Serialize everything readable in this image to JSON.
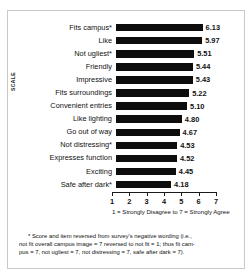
{
  "chart_data": {
    "type": "bar",
    "orientation": "horizontal",
    "title": "",
    "xlabel": "1 = Strongly Disagree to 7 = Strongly Agree",
    "ylabel": "SCALE",
    "xlim": [
      1,
      7
    ],
    "xticks": [
      1,
      2,
      3,
      4,
      5,
      6,
      7
    ],
    "grid": false,
    "legend": false,
    "categories": [
      "Fits campus*",
      "Like",
      "Not ugliest*",
      "Friendly",
      "Impressive",
      "Fits surroundings",
      "Convenient entries",
      "Like lighting",
      "Go out of way",
      "Not distressing*",
      "Expresses function",
      "Exciting",
      "Safe after dark*"
    ],
    "values": [
      6.13,
      5.97,
      5.51,
      5.44,
      5.43,
      5.22,
      5.1,
      4.8,
      4.67,
      4.53,
      4.52,
      4.45,
      4.18
    ],
    "value_labels": [
      "6.13",
      "5.97",
      "5.51",
      "5.44",
      "5.43",
      "5.22",
      "5.10",
      "4.80",
      "4.67",
      "4.53",
      "4.52",
      "4.45",
      "4.18"
    ],
    "bar_color": "#0d0d0d",
    "tick_labels": [
      "1",
      "2",
      "3",
      "4",
      "5",
      "6",
      "7"
    ]
  },
  "footnote": {
    "line1": "* Score and item reversed from survey's negative wording (i.e.,",
    "line2": "not fit overall campus image = 7 reversed to not fit = 1; thus fit cam-",
    "line3": "pus = 7, not ugliest = 7, not distressing = 7,  safe after dark = 7)."
  }
}
